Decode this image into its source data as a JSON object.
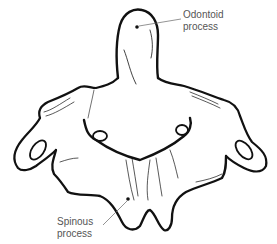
{
  "figure": {
    "labels": {
      "odontoid": {
        "line1": "Odontoid",
        "line2": "process"
      },
      "spinous": {
        "line1": "Spinous",
        "line2": "process"
      }
    },
    "colors": {
      "outline": "#111111",
      "label_text": "#555555",
      "leader_line": "#666666",
      "background": "#ffffff"
    }
  }
}
